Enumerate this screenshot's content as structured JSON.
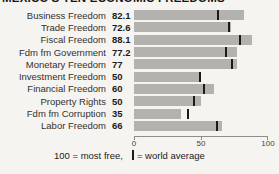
{
  "page": {
    "title": "MEXICO'S TEN ECONOMIC FREEDOMS"
  },
  "chart_data": {
    "type": "bar",
    "orientation": "horizontal",
    "title": "MEXICO'S TEN ECONOMIC FREEDOMS",
    "categories": [
      "Business Freedom",
      "Trade Freedom",
      "Fiscal Freedom",
      "Fdm fm Government",
      "Monetary Freedom",
      "Investment Freedom",
      "Financial Freedom",
      "Property Rights",
      "Fdm fm Corruption",
      "Labor Freedom"
    ],
    "values": [
      82.1,
      72.6,
      88.1,
      77.2,
      77,
      50,
      60,
      50,
      35,
      66
    ],
    "value_labels": [
      "82.1",
      "72.6",
      "88.1",
      "77.2",
      "77",
      "50",
      "60",
      "50",
      "35",
      "66"
    ],
    "world_averages": [
      63,
      71,
      79,
      69,
      73,
      49,
      52,
      45,
      40,
      62
    ],
    "xlim": [
      0,
      100
    ],
    "x_tick_labels": [
      "0",
      "50",
      "100"
    ],
    "grid": "off",
    "bar_color": "#b4b2ae",
    "world_average_marker_color": "#1c1b19",
    "legend": {
      "scale_note": "100 = most free,",
      "marker_note": "= world average"
    }
  }
}
